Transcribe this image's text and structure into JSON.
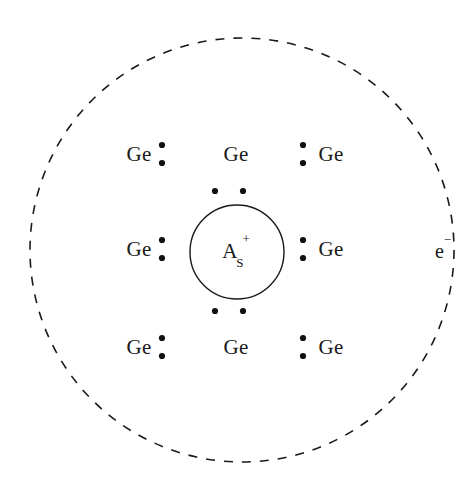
{
  "figure": {
    "background_color": "#ffffff",
    "stroke_color": "#1a1a1a",
    "width": 472,
    "height": 491
  },
  "outer_orbit": {
    "name": "electron-orbit",
    "style": "dashed",
    "center_x": 242,
    "center_y": 250,
    "radius": 212,
    "stroke_color": "#1a1a1a",
    "stroke_width": 1.6,
    "dash_pattern": "9 9"
  },
  "core": {
    "name": "donor-ion",
    "center_x": 237,
    "center_y": 252,
    "radius": 47,
    "stroke_color": "#1a1a1a",
    "stroke_width": 1.4,
    "element": "A",
    "subscript": "S",
    "superscript": "+",
    "full_label": "As+"
  },
  "carrier": {
    "name": "free-electron",
    "symbol": "e",
    "superscript": "−",
    "full_label": "e−",
    "x": 443,
    "y": 250
  },
  "lattice_atoms": [
    {
      "label": "Ge",
      "x": 139,
      "y": 154,
      "row": 0,
      "col": 0
    },
    {
      "label": "Ge",
      "x": 236,
      "y": 154,
      "row": 0,
      "col": 1
    },
    {
      "label": "Ge",
      "x": 331,
      "y": 154,
      "row": 0,
      "col": 2
    },
    {
      "label": "Ge",
      "x": 139,
      "y": 249,
      "row": 1,
      "col": 0
    },
    {
      "label": "Ge",
      "x": 331,
      "y": 249,
      "row": 1,
      "col": 2
    },
    {
      "label": "Ge",
      "x": 139,
      "y": 347,
      "row": 2,
      "col": 0
    },
    {
      "label": "Ge",
      "x": 236,
      "y": 347,
      "row": 2,
      "col": 1
    },
    {
      "label": "Ge",
      "x": 331,
      "y": 347,
      "row": 2,
      "col": 2
    }
  ],
  "bond_electrons": {
    "radius": 3.1,
    "fill_color": "#111111",
    "pairs": [
      {
        "name": "bond-top-left-to-top-mid",
        "cx": 162,
        "cy": 154,
        "orientation": "vertical",
        "gap": 18
      },
      {
        "name": "bond-top-mid-to-top-right",
        "cx": 303,
        "cy": 154,
        "orientation": "vertical",
        "gap": 18
      },
      {
        "name": "bond-mid-left-to-core",
        "cx": 162,
        "cy": 249,
        "orientation": "vertical",
        "gap": 18
      },
      {
        "name": "bond-core-to-mid-right",
        "cx": 303,
        "cy": 249,
        "orientation": "vertical",
        "gap": 18
      },
      {
        "name": "bond-bottom-left-to-bottom-mid",
        "cx": 162,
        "cy": 347,
        "orientation": "vertical",
        "gap": 18
      },
      {
        "name": "bond-bottom-mid-to-bottom-right",
        "cx": 303,
        "cy": 347,
        "orientation": "vertical",
        "gap": 18
      },
      {
        "name": "bond-top-mid-to-core",
        "cx": 229,
        "cy": 191,
        "orientation": "horizontal",
        "gap": 28
      },
      {
        "name": "bond-core-to-bottom-mid",
        "cx": 229,
        "cy": 311,
        "orientation": "horizontal",
        "gap": 28
      }
    ]
  }
}
